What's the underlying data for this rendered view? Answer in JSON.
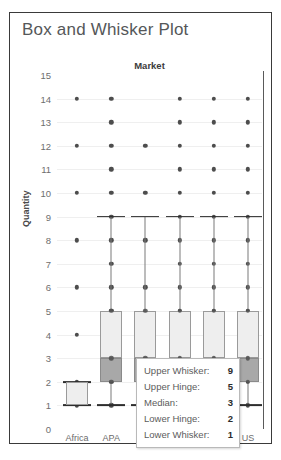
{
  "card": {
    "title": "Box and Whisker Plot"
  },
  "chart_data": {
    "type": "box",
    "title": "Market",
    "xlabel": "",
    "ylabel": "Quantity",
    "ylim": [
      0,
      15
    ],
    "yticks": [
      15,
      14,
      13,
      12,
      11,
      10,
      9,
      8,
      7,
      6,
      5,
      4,
      3,
      2,
      1,
      0
    ],
    "grid": true,
    "legend": "none",
    "categories": [
      "Africa",
      "APA",
      "Europe",
      "LATAM",
      "MEA",
      "US"
    ],
    "visible_category_labels": [
      "Africa",
      "APA",
      "US"
    ],
    "series": [
      {
        "name": "Africa",
        "lower_whisker": 1,
        "lower_hinge": 1,
        "median": 1,
        "upper_hinge": 2,
        "upper_whisker": 2,
        "points": [
          14,
          12,
          10,
          8,
          6,
          4,
          2,
          1
        ]
      },
      {
        "name": "APA",
        "lower_whisker": 1,
        "lower_hinge": 2,
        "median": 3,
        "upper_hinge": 5,
        "upper_whisker": 9,
        "points": [
          14,
          13,
          12,
          11,
          10,
          9,
          8,
          7,
          6,
          5,
          4,
          3,
          2,
          1
        ]
      },
      {
        "name": "Europe",
        "lower_whisker": 1,
        "lower_hinge": 2,
        "median": 3,
        "upper_hinge": 5,
        "upper_whisker": 9,
        "points": [
          12,
          10,
          8,
          6,
          4,
          3,
          2,
          1
        ]
      },
      {
        "name": "LATAM",
        "lower_whisker": 1,
        "lower_hinge": 2,
        "median": 3,
        "upper_hinge": 5,
        "upper_whisker": 9,
        "points": [
          14,
          13,
          12,
          11,
          10,
          9,
          8,
          7,
          6,
          5,
          4,
          3,
          2,
          1
        ]
      },
      {
        "name": "MEA",
        "lower_whisker": 1,
        "lower_hinge": 2,
        "median": 3,
        "upper_hinge": 5,
        "upper_whisker": 9,
        "points": [
          14,
          13,
          12,
          11,
          10,
          9,
          8,
          7,
          6,
          5,
          4,
          3,
          2,
          1
        ]
      },
      {
        "name": "US",
        "lower_whisker": 1,
        "lower_hinge": 2,
        "median": 3,
        "upper_hinge": 5,
        "upper_whisker": 9,
        "points": [
          14,
          13,
          12,
          11,
          10,
          9,
          8,
          7,
          6,
          5,
          4,
          3,
          2,
          1
        ]
      }
    ]
  },
  "tooltip": {
    "rows": [
      {
        "label": "Upper Whisker:",
        "value": "9"
      },
      {
        "label": "Upper Hinge:",
        "value": "5"
      },
      {
        "label": "Median:",
        "value": "3"
      },
      {
        "label": "Lower Hinge:",
        "value": "2"
      },
      {
        "label": "Lower Whisker:",
        "value": "1"
      }
    ]
  },
  "colors": {
    "frame": "#3a3a3a",
    "title_text": "#555759",
    "tick_text": "#6e6e6e",
    "dot": "#4d4d4d",
    "box_upper_fill": "#eeeeee",
    "box_lower_fill": "#a8a8a8",
    "whisker": "#7a7a7a",
    "gridline": "#efefef"
  }
}
